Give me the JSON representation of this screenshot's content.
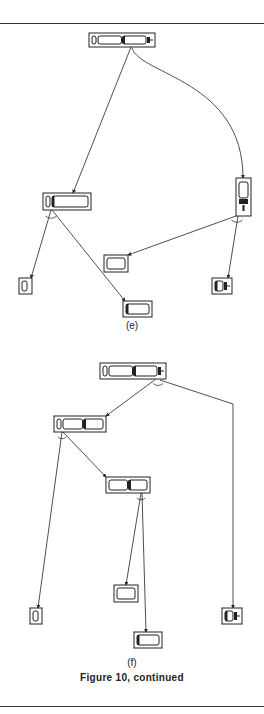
{
  "figure": {
    "caption": "Figure 10, continued",
    "panels": [
      {
        "label": "(e)",
        "label_y": 326,
        "nodes": [
          {
            "id": "e-root",
            "x": 89,
            "y": 33,
            "w": 66,
            "h": 14,
            "parts": [
              "end-cap",
              "body",
              "body-dark-left",
              "connector"
            ]
          },
          {
            "id": "e-left",
            "x": 43,
            "y": 193,
            "w": 48,
            "h": 17,
            "parts": [
              "end-cap",
              "body-dark-left"
            ]
          },
          {
            "id": "e-right",
            "x": 236,
            "y": 178,
            "w": 15,
            "h": 38,
            "parts": [
              "vertical-body",
              "connector-down"
            ]
          },
          {
            "id": "e-ll",
            "x": 19,
            "y": 278,
            "w": 13,
            "h": 16,
            "parts": [
              "end-cap"
            ]
          },
          {
            "id": "e-lr",
            "x": 123,
            "y": 301,
            "w": 29,
            "h": 16,
            "parts": [
              "body-dark-left"
            ]
          },
          {
            "id": "e-rl",
            "x": 104,
            "y": 255,
            "w": 24,
            "h": 17,
            "parts": [
              "body"
            ]
          },
          {
            "id": "e-rr",
            "x": 212,
            "y": 278,
            "w": 20,
            "h": 16,
            "parts": [
              "body-dark-left",
              "connector"
            ]
          }
        ],
        "edges": [
          {
            "from": [
              131,
              47
            ],
            "to": [
              73,
              193
            ],
            "type": "line"
          },
          {
            "from": [
              132,
              48
            ],
            "to": [
              243,
              178
            ],
            "type": "curve",
            "c1": [
              140,
              75
            ],
            "c2": [
              243,
              80
            ]
          },
          {
            "from": [
              51,
              210
            ],
            "to": [
              31,
              278
            ],
            "type": "line"
          },
          {
            "from": [
              52,
              210
            ],
            "to": [
              125,
              301
            ],
            "type": "line"
          },
          {
            "from": [
              236,
              216
            ],
            "to": [
              128,
              255
            ],
            "type": "line"
          },
          {
            "from": [
              238,
              216
            ],
            "to": [
              228,
              278
            ],
            "type": "line"
          }
        ],
        "arcs": [
          {
            "cx": 51,
            "cy": 212,
            "r": 8
          },
          {
            "cx": 237,
            "cy": 216,
            "r": 8
          }
        ]
      },
      {
        "label": "(f)",
        "label_y": 664,
        "nodes": [
          {
            "id": "f-root",
            "x": 100,
            "y": 363,
            "w": 66,
            "h": 16,
            "parts": [
              "end-cap",
              "body",
              "body-dark-left",
              "connector"
            ]
          },
          {
            "id": "f-mid",
            "x": 54,
            "y": 416,
            "w": 52,
            "h": 16,
            "parts": [
              "end-cap",
              "body",
              "body-dark-left"
            ]
          },
          {
            "id": "f-mid2",
            "x": 106,
            "y": 477,
            "w": 44,
            "h": 16,
            "parts": [
              "body",
              "body-dark-left"
            ]
          },
          {
            "id": "f-leaf1",
            "x": 30,
            "y": 608,
            "w": 12,
            "h": 16,
            "parts": [
              "end-cap"
            ]
          },
          {
            "id": "f-leaf2",
            "x": 114,
            "y": 585,
            "w": 24,
            "h": 17,
            "parts": [
              "body"
            ]
          },
          {
            "id": "f-leaf3",
            "x": 134,
            "y": 632,
            "w": 28,
            "h": 16,
            "parts": [
              "body-dark-left"
            ]
          },
          {
            "id": "f-leaf4",
            "x": 222,
            "y": 608,
            "w": 20,
            "h": 16,
            "parts": [
              "body-dark-left",
              "connector"
            ]
          }
        ],
        "edges": [
          {
            "from": [
              156,
              379
            ],
            "to": [
              106,
              416
            ],
            "type": "line"
          },
          {
            "from": [
              160,
              380
            ],
            "to": [
              233,
              404
            ],
            "type": "line"
          },
          {
            "from": [
              233,
              404
            ],
            "to": [
              233,
              608
            ],
            "type": "line"
          },
          {
            "from": [
              62,
              432
            ],
            "to": [
              38,
              608
            ],
            "type": "line"
          },
          {
            "from": [
              63,
              432
            ],
            "to": [
              106,
              477
            ],
            "type": "line"
          },
          {
            "from": [
              141,
              493
            ],
            "to": [
              126,
              585
            ],
            "type": "line"
          },
          {
            "from": [
              142,
              493
            ],
            "to": [
              146,
              632
            ],
            "type": "line"
          }
        ],
        "arcs": [
          {
            "cx": 158,
            "cy": 380,
            "r": 7
          },
          {
            "cx": 62,
            "cy": 434,
            "r": 6
          },
          {
            "cx": 141,
            "cy": 495,
            "r": 6
          }
        ]
      }
    ],
    "rules": [
      23,
      706
    ],
    "colors": {
      "ink": "#222222",
      "paper": "#ffffff"
    }
  }
}
